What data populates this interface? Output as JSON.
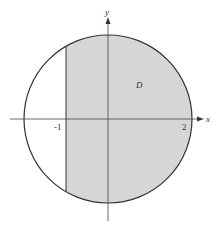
{
  "figure": {
    "region_label": "D",
    "axis_labels": {
      "x": "x",
      "y": "y"
    },
    "tick_labels": {
      "left_line": "-1",
      "right_edge": "2"
    },
    "colors": {
      "region_fill": "#d6d6d6",
      "stroke": "#333333",
      "background": "#ffffff"
    }
  }
}
